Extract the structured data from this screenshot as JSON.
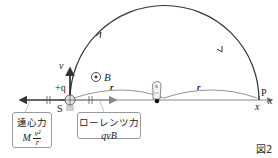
{
  "figure": {
    "label": "図2"
  },
  "labels": {
    "velocity": "v",
    "field": "B",
    "charge": "+q",
    "source": "S",
    "radius_left": "r",
    "radius_right": "r",
    "point": "P",
    "axis": "x",
    "point_coord": "x"
  },
  "forces": {
    "centrifugal": {
      "name": "遠心力",
      "formula_prefix": "M",
      "formula_num": "v²",
      "formula_den": "r"
    },
    "lorentz": {
      "name": "ローレンツ力",
      "formula": "qvB"
    }
  },
  "colors": {
    "line": "#333333",
    "axis": "#888888",
    "box_border": "#9a9a9a"
  }
}
